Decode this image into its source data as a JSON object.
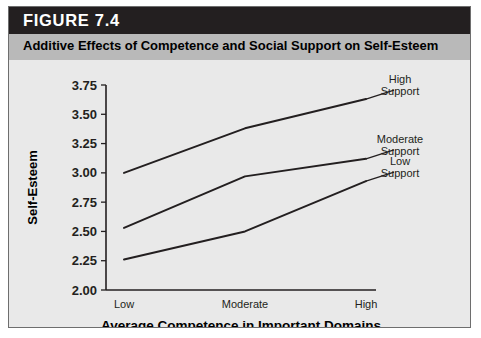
{
  "figure": {
    "number_label": "FIGURE 7.4",
    "caption": "Additive Effects of Competence and Social Support on Self-Esteem"
  },
  "colors": {
    "banner_background": "#231f20",
    "banner_text": "#ffffff",
    "subbar_background": "#b9b9b9",
    "subbar_text": "#000000",
    "plot_background": "#e9e9e9",
    "line": "#231f20",
    "border": "#6e6e6e"
  },
  "chart_data": {
    "type": "line",
    "title": "Additive Effects of Competence and Social Support on Self-Esteem",
    "xlabel": "Average Competence in Important Domains",
    "ylabel": "Self-Esteem",
    "categories": [
      "Low",
      "Moderate",
      "High"
    ],
    "ytick_labels": [
      "2.00",
      "2.25",
      "2.50",
      "2.75",
      "3.00",
      "3.25",
      "3.50",
      "3.75"
    ],
    "ytick_values": [
      2.0,
      2.25,
      2.5,
      2.75,
      3.0,
      3.25,
      3.5,
      3.75
    ],
    "ylim": [
      2.0,
      3.75
    ],
    "grid": false,
    "legend_position": "right-inline",
    "series": [
      {
        "name": "High Support",
        "label_line1": "High",
        "label_line2": "Support",
        "values": [
          3.0,
          3.38,
          3.63
        ]
      },
      {
        "name": "Moderate Support",
        "label_line1": "Moderate",
        "label_line2": "Support",
        "values": [
          2.53,
          2.97,
          3.12
        ]
      },
      {
        "name": "Low Support",
        "label_line1": "Low",
        "label_line2": "Support",
        "values": [
          2.26,
          2.5,
          2.93
        ]
      }
    ]
  }
}
